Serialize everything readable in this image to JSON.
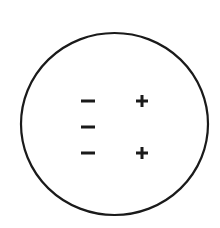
{
  "diagram": {
    "colors": {
      "background": "#ffffff",
      "stroke": "#1a1a1a"
    },
    "boundary": {
      "shape": "circle",
      "cx": 114.5,
      "cy": 124,
      "rx": 93.5,
      "ry": 91,
      "stroke_width": 2.2
    },
    "charges": {
      "negative": [
        {
          "symbol": "−",
          "x": 88,
          "y": 101
        },
        {
          "symbol": "−",
          "x": 88,
          "y": 127
        },
        {
          "symbol": "−",
          "x": 88,
          "y": 153
        }
      ],
      "positive": [
        {
          "symbol": "+",
          "x": 142,
          "y": 101
        },
        {
          "symbol": "+",
          "x": 142,
          "y": 153
        }
      ]
    },
    "counts": {
      "negative": 3,
      "positive": 2
    }
  }
}
